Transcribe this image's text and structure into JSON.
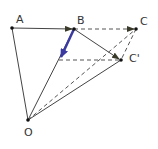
{
  "diagram": {
    "type": "vector-geometry",
    "points": {
      "A": {
        "label": "A",
        "x": 12,
        "y": 28
      },
      "B": {
        "label": "B",
        "x": 74,
        "y": 29
      },
      "C": {
        "label": "C",
        "x": 136,
        "y": 29
      },
      "Cp": {
        "label": "C'",
        "x": 121,
        "y": 60
      },
      "O": {
        "label": "O",
        "x": 28,
        "y": 120
      },
      "M": {
        "x": 59,
        "y": 60
      }
    },
    "colors": {
      "line": "#444444",
      "dashed": "#555555",
      "arrowhead": "#3a3a2a",
      "blue_vector": "#3a3aa0",
      "point": "#111111"
    }
  }
}
